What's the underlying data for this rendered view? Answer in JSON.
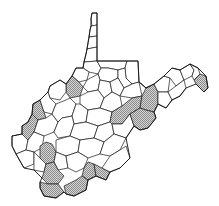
{
  "map": {
    "region": "West Virginia",
    "subdivision": "counties",
    "legend": null,
    "colors": {
      "background": "#ffffff",
      "border": "#1a1a1a",
      "shaded_fill": "#bdbdbd",
      "unshaded_fill": "#ffffff"
    },
    "shaded_pattern": "dotted-gray",
    "shaded_count": 14,
    "shaded_regions": [
      "northern-central county",
      "eastern panhandle easternmost county",
      "eastern ridge county north",
      "eastern ridge county south",
      "central-east county",
      "western county north",
      "western county south",
      "southwestern county",
      "southern county west",
      "southern county central-west",
      "southern county central",
      "southern county central-east",
      "southern county east"
    ]
  }
}
